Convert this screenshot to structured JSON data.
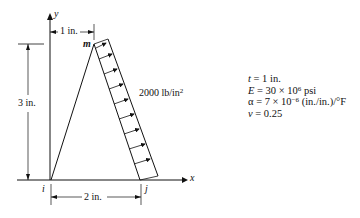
{
  "diagram": {
    "axes": {
      "x_label": "x",
      "y_label": "y"
    },
    "nodes": {
      "i": "i",
      "j": "j",
      "m": "m"
    },
    "dimensions": {
      "horizontal_top": "1 in.",
      "vertical_left": "3 in.",
      "horizontal_bottom": "2 in."
    },
    "load": {
      "label": "2000 lb/in",
      "exponent": "2",
      "arrow_count": 9
    }
  },
  "properties": [
    {
      "symbol": "t",
      "text": " = 1 in."
    },
    {
      "symbol": "E",
      "text": " = 30 × 10",
      "sup": "6",
      "after": " psi"
    },
    {
      "symbol": "α",
      "text": " = 7 × 10",
      "sup": "−6",
      "after": " (in./in.)/°F"
    },
    {
      "symbol": "ν",
      "text": " = 0.25"
    }
  ]
}
